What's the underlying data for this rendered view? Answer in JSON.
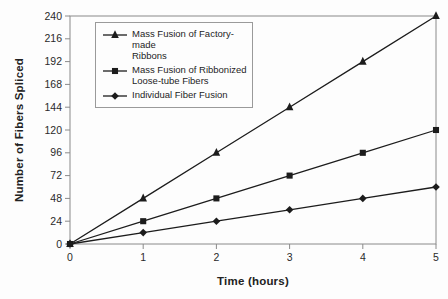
{
  "chart_data": {
    "type": "line",
    "title": "",
    "xlabel": "Time (hours)",
    "ylabel": "Number of Fibers Spliced",
    "x": [
      0,
      1,
      2,
      3,
      4,
      5
    ],
    "x_ticks": [
      0,
      1,
      2,
      3,
      4,
      5
    ],
    "y_ticks": [
      0,
      24,
      48,
      72,
      96,
      120,
      144,
      168,
      192,
      216,
      240
    ],
    "xlim": [
      0,
      5
    ],
    "ylim": [
      0,
      240
    ],
    "grid": false,
    "legend_position": "top-left-inside",
    "series": [
      {
        "name": "Mass Fusion of Factory-made Ribbons",
        "label_lines": [
          "Mass Fusion of Factory-made",
          "Ribbons"
        ],
        "marker": "triangle",
        "values": [
          0,
          48,
          96,
          144,
          192,
          240
        ]
      },
      {
        "name": "Mass Fusion of Ribbonized Loose-tube Fibers",
        "label_lines": [
          "Mass Fusion of Ribbonized",
          "Loose-tube Fibers"
        ],
        "marker": "square",
        "values": [
          0,
          24,
          48,
          72,
          96,
          120
        ]
      },
      {
        "name": "Individual Fiber Fusion",
        "label_lines": [
          "Individual Fiber Fusion"
        ],
        "marker": "diamond",
        "values": [
          0,
          12,
          24,
          36,
          48,
          60
        ]
      }
    ],
    "colors": {
      "line": "#1c1c1c",
      "axis": "#8a8a8a",
      "text": "#222222",
      "background": "#fdfdfd"
    }
  }
}
